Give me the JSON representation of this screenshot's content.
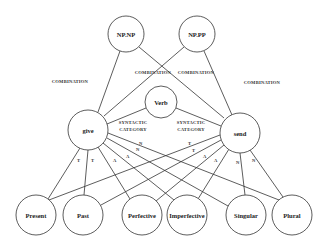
{
  "diagram": {
    "nodes": {
      "npnp": {
        "label": "NP.NP",
        "cx": 126,
        "cy": 34,
        "r": 18
      },
      "nppp": {
        "label": "NP.PP",
        "cx": 197,
        "cy": 34,
        "r": 18
      },
      "verb": {
        "label": "Verb",
        "cx": 161,
        "cy": 102,
        "r": 16
      },
      "give": {
        "label": "give",
        "cx": 88,
        "cy": 130,
        "r": 20
      },
      "send": {
        "label": "send",
        "cx": 240,
        "cy": 133,
        "r": 20
      },
      "present": {
        "label": "Present",
        "cx": 36,
        "cy": 215,
        "r": 20
      },
      "past": {
        "label": "Past",
        "cx": 83,
        "cy": 215,
        "r": 20
      },
      "perfective": {
        "label": "Perfective",
        "cx": 142,
        "cy": 215,
        "r": 20
      },
      "imperfective": {
        "label": "Imperfective",
        "cx": 187,
        "cy": 215,
        "r": 20
      },
      "singular": {
        "label": "Singular",
        "cx": 246,
        "cy": 215,
        "r": 20
      },
      "plural": {
        "label": "Plural",
        "cx": 292,
        "cy": 215,
        "r": 20
      }
    },
    "edge_labels": {
      "combination": "COMBINATION",
      "syntactic": "SYNTACTIC",
      "category": "CATEGORY",
      "tense": "T",
      "aspect": "A",
      "number": "N"
    }
  }
}
